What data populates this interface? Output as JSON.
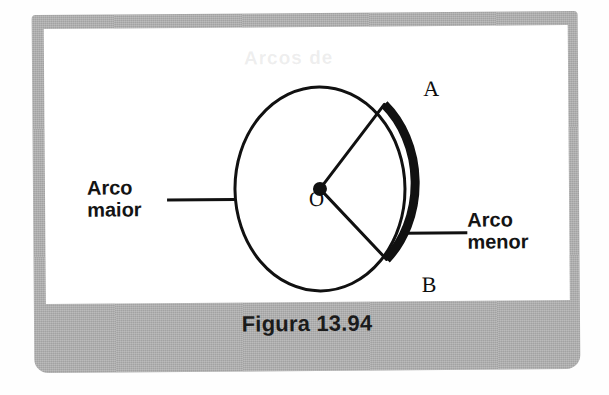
{
  "figure": {
    "caption": "Figura 13.94",
    "ghost_text": "Arcos de",
    "labels": {
      "arco_maior": "Arco\nmaior",
      "arco_menor": "Arco\nmenor",
      "point_a": "A",
      "point_b": "B",
      "center_o": "O"
    },
    "colors": {
      "panel_gray": "#aeaeae",
      "drawing_white": "#ffffff",
      "ink_black": "#111111",
      "page_white": "#fefefe"
    },
    "geometry": {
      "center_x": 275,
      "center_y": 162,
      "radius_x": 85,
      "radius_y": 102,
      "point_a_x": 340,
      "point_a_y": 78,
      "point_b_x": 341,
      "point_b_y": 233,
      "minor_arc_stroke_width": 9,
      "circle_stroke_width": 3,
      "radius_stroke_width": 3,
      "center_dot_radius": 7,
      "leader_left_x1": 122,
      "leader_left_x2": 190,
      "leader_left_y": 172,
      "leader_right_x1": 358,
      "leader_right_x2": 422,
      "leader_right_y": 207
    }
  }
}
